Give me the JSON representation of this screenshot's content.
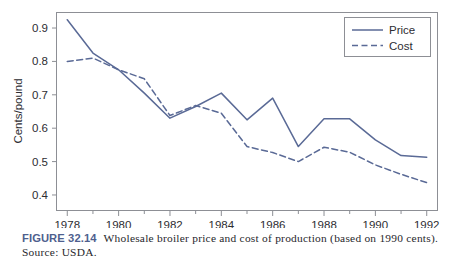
{
  "chart_data": {
    "type": "line",
    "title": "",
    "xlabel": "",
    "ylabel": "Cents/pound",
    "x": [
      1978,
      1979,
      1980,
      1981,
      1982,
      1983,
      1984,
      1985,
      1986,
      1987,
      1988,
      1989,
      1990,
      1991,
      1992
    ],
    "xlim": [
      1977.6,
      1992.4
    ],
    "ylim": [
      0.355,
      0.945
    ],
    "xticks_major": [
      1978,
      1980,
      1982,
      1984,
      1986,
      1988,
      1990,
      1992
    ],
    "xticklabels": [
      "1978",
      "1980",
      "1982",
      "1984",
      "1986",
      "1988",
      "1990",
      "1992"
    ],
    "xticks_minor": [
      1979,
      1981,
      1983,
      1985,
      1987,
      1989,
      1991
    ],
    "yticks": [
      0.4,
      0.5,
      0.6,
      0.7,
      0.8,
      0.9
    ],
    "yticklabels": [
      "0.4",
      "0.5",
      "0.6",
      "0.7",
      "0.8",
      "0.9"
    ],
    "grid": false,
    "legend_position": "top-right",
    "series": [
      {
        "name": "Price",
        "style": "solid",
        "color": "#5a6a96",
        "values": [
          0.925,
          0.825,
          0.775,
          0.705,
          0.63,
          0.665,
          0.705,
          0.625,
          0.69,
          0.545,
          0.628,
          0.628,
          0.565,
          0.518,
          0.513
        ]
      },
      {
        "name": "Cost",
        "style": "dashed",
        "color": "#5a6a96",
        "values": [
          0.8,
          0.81,
          0.775,
          0.748,
          0.638,
          0.668,
          0.645,
          0.545,
          0.527,
          0.5,
          0.543,
          0.528,
          0.49,
          0.462,
          0.437
        ]
      }
    ],
    "legend": [
      {
        "label": "Price",
        "style": "solid"
      },
      {
        "label": "Cost",
        "style": "dashed"
      }
    ]
  },
  "caption": {
    "figure_label": "FIGURE 32.14",
    "text": "Wholesale broiler price and cost of production (based on 1990 cents).",
    "source": "Source: USDA."
  },
  "colors": {
    "line": "#5a6a96",
    "frame": "#8d8f95",
    "axis_text": "#2d2d32",
    "figure_label": "#4e5f8e",
    "caption_text": "#27272c"
  }
}
